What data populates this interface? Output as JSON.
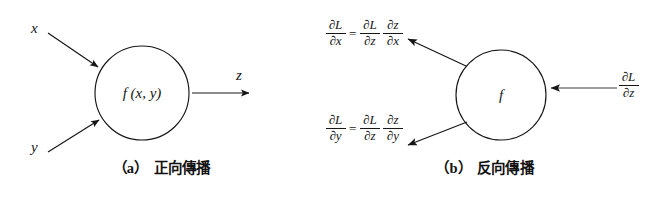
{
  "figure": {
    "background_color": "#ffffff",
    "ink_color": "#161616",
    "width": 646,
    "height": 199
  },
  "panel_a": {
    "caption_tag": "（a）",
    "caption_text": "正向傳播",
    "node_label": "f (x, y)",
    "inputs": [
      {
        "label": "x",
        "direction": "down-right"
      },
      {
        "label": "y",
        "direction": "up-right"
      }
    ],
    "outputs": [
      {
        "label": "z",
        "direction": "right"
      }
    ]
  },
  "panel_b": {
    "caption_tag": "（b）",
    "caption_text": "反向傳播",
    "node_label": "f",
    "incoming": {
      "numerator": "∂L",
      "denominator": "∂z",
      "direction": "left"
    },
    "outgoing": [
      {
        "direction": "up-left",
        "lhs_num": "∂L",
        "lhs_den": "∂x",
        "operator": "=",
        "rhs1_num": "∂L",
        "rhs1_den": "∂z",
        "rhs2_num": "∂z",
        "rhs2_den": "∂x"
      },
      {
        "direction": "down-left",
        "lhs_num": "∂L",
        "lhs_den": "∂y",
        "operator": "=",
        "rhs1_num": "∂L",
        "rhs1_den": "∂z",
        "rhs2_num": "∂z",
        "rhs2_den": "∂y"
      }
    ]
  }
}
